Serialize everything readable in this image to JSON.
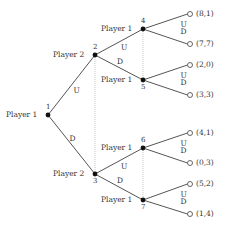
{
  "diagram": {
    "type": "extensive-form game tree",
    "colors": {
      "edge": "#555555",
      "node": "#111111",
      "infoset": "#bbbbbb",
      "text": "#333333"
    },
    "nodes": [
      {
        "id": "1",
        "player": "Player 1",
        "x": 48,
        "y": 115
      },
      {
        "id": "2",
        "player": "Player 2",
        "x": 95,
        "y": 55
      },
      {
        "id": "3",
        "player": "Player 2",
        "x": 95,
        "y": 174
      },
      {
        "id": "4",
        "player": "Player 1",
        "x": 143,
        "y": 29
      },
      {
        "id": "5",
        "player": "Player 1",
        "x": 143,
        "y": 80
      },
      {
        "id": "6",
        "player": "Player 1",
        "x": 143,
        "y": 148
      },
      {
        "id": "7",
        "player": "Player 1",
        "x": 143,
        "y": 200
      }
    ],
    "edges": [
      {
        "from": "1",
        "to": "2",
        "action": "U"
      },
      {
        "from": "1",
        "to": "3",
        "action": "D"
      },
      {
        "from": "2",
        "to": "4",
        "action": "U"
      },
      {
        "from": "2",
        "to": "5",
        "action": "D"
      },
      {
        "from": "3",
        "to": "6",
        "action": "U"
      },
      {
        "from": "3",
        "to": "7",
        "action": "D"
      }
    ],
    "information_sets": [
      [
        "2",
        "3"
      ],
      [
        "4",
        "5"
      ],
      [
        "6",
        "7"
      ]
    ],
    "terminals": [
      {
        "parent": "4",
        "action": "U",
        "payoff": "(8,1)",
        "x": 190,
        "y": 14
      },
      {
        "parent": "4",
        "action": "D",
        "payoff": "(7,7)",
        "x": 190,
        "y": 44
      },
      {
        "parent": "5",
        "action": "U",
        "payoff": "(2,0)",
        "x": 190,
        "y": 65
      },
      {
        "parent": "5",
        "action": "D",
        "payoff": "(3,3)",
        "x": 190,
        "y": 95
      },
      {
        "parent": "6",
        "action": "U",
        "payoff": "(4,1)",
        "x": 190,
        "y": 133
      },
      {
        "parent": "6",
        "action": "D",
        "payoff": "(0,3)",
        "x": 190,
        "y": 163
      },
      {
        "parent": "7",
        "action": "U",
        "payoff": "(5,2)",
        "x": 190,
        "y": 184
      },
      {
        "parent": "7",
        "action": "D",
        "payoff": "(1,4)",
        "x": 190,
        "y": 214
      }
    ]
  }
}
